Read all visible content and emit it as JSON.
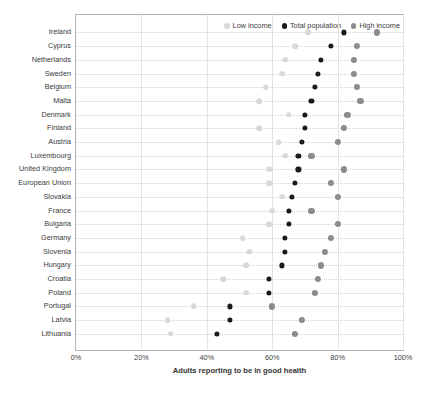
{
  "chart_data": {
    "type": "scatter",
    "title": "",
    "xlabel": "Adults reporting to be in good health",
    "ylabel": "",
    "xlim": [
      0,
      100
    ],
    "xticks": [
      "0%",
      "20%",
      "40%",
      "60%",
      "80%",
      "100%"
    ],
    "xtick_values": [
      0,
      20,
      40,
      60,
      80,
      100
    ],
    "grid": true,
    "legend_position": "top-right",
    "colors": {
      "low_income": "#d9d9d9",
      "total_population": "#1a1a1a",
      "high_income": "#8c8c8c"
    },
    "legend": [
      {
        "name": "Low income",
        "color": "#d9d9d9"
      },
      {
        "name": "Total population",
        "color": "#1a1a1a"
      },
      {
        "name": "High income",
        "color": "#8c8c8c"
      }
    ],
    "categories": [
      "Ireland",
      "Cyprus",
      "Netherlands",
      "Sweden",
      "Belgium",
      "Malta",
      "Denmark",
      "Finland",
      "Austria",
      "Luxembourg",
      "United Kingdom",
      "European Union",
      "Slovakia",
      "France",
      "Bulgaria",
      "Germany",
      "Slovenia",
      "Hungary",
      "Croatia",
      "Poland",
      "Portugal",
      "Latvia",
      "Lithuania"
    ],
    "series": [
      {
        "name": "Low income",
        "color": "#d9d9d9",
        "values": [
          71,
          67,
          64,
          63,
          58,
          56,
          65,
          56,
          62,
          64,
          59,
          59,
          63,
          60,
          59,
          51,
          53,
          52,
          45,
          52,
          36,
          28,
          29
        ]
      },
      {
        "name": "Total population",
        "color": "#1a1a1a",
        "values": [
          82,
          78,
          75,
          74,
          73,
          72,
          70,
          70,
          69,
          68,
          68,
          67,
          66,
          65,
          65,
          64,
          64,
          63,
          59,
          59,
          47,
          47,
          43
        ]
      },
      {
        "name": "High income",
        "color": "#8c8c8c",
        "values": [
          92,
          86,
          85,
          85,
          86,
          87,
          83,
          82,
          80,
          72,
          82,
          78,
          80,
          72,
          80,
          78,
          76,
          75,
          74,
          73,
          60,
          69,
          67
        ]
      }
    ]
  },
  "axis": {
    "x_title": "Adults reporting to be in good health"
  }
}
